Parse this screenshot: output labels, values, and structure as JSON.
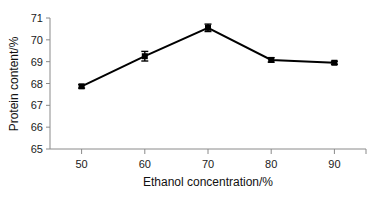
{
  "chart_data": {
    "type": "line",
    "title": "",
    "xlabel": "Ethanol concentration/%",
    "ylabel": "Protein content/%",
    "categories": [
      50,
      60,
      70,
      80,
      90
    ],
    "x": [
      50,
      60,
      70,
      80,
      90
    ],
    "values": [
      67.87,
      69.25,
      70.55,
      69.08,
      68.95
    ],
    "errors": [
      0.08,
      0.22,
      0.17,
      0.1,
      0.07
    ],
    "series": [
      {
        "name": "Protein content",
        "values": [
          67.87,
          69.25,
          70.55,
          69.08,
          68.95
        ],
        "errors": [
          0.08,
          0.22,
          0.17,
          0.1,
          0.07
        ]
      }
    ],
    "xlim": [
      45,
      95
    ],
    "ylim": [
      65,
      71
    ],
    "xticks": [
      50,
      60,
      70,
      80,
      90
    ],
    "yticks": [
      65,
      66,
      67,
      68,
      69,
      70,
      71
    ],
    "xtick_labels": [
      "50",
      "60",
      "70",
      "80",
      "90"
    ],
    "ytick_labels": [
      "65",
      "66",
      "67",
      "68",
      "69",
      "70",
      "71"
    ],
    "grid": false,
    "legend": false,
    "legend_position": "none",
    "marker": "square",
    "marker_color": "#000000",
    "line_color": "#000000",
    "background_color": "#ffffff",
    "axis_color": "#8a8a8a"
  },
  "axes": {
    "y_title": "Protein content/%",
    "x_title": "Ethanol concentration/%"
  }
}
